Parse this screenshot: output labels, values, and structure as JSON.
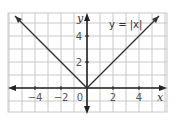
{
  "chart_data": {
    "type": "line",
    "title": "",
    "xlabel": "x",
    "ylabel": "y",
    "xlim": [
      -6,
      6
    ],
    "ylim": [
      -2,
      6
    ],
    "grid": true,
    "x_ticks": [
      -4,
      -2,
      0,
      2,
      4
    ],
    "y_ticks": [
      2,
      4
    ],
    "x_tick_labels": [
      "−4",
      "−2",
      "0",
      "2",
      "4"
    ],
    "y_tick_labels": [
      "2",
      "4"
    ],
    "series": [
      {
        "name": "y = |x|",
        "x": [
          -6,
          -4,
          -2,
          0,
          2,
          4,
          6
        ],
        "y": [
          6,
          4,
          2,
          0,
          2,
          4,
          6
        ]
      }
    ],
    "annotations": [
      {
        "text": "y = |x|",
        "x": 3.5,
        "y": 4.6
      }
    ]
  }
}
